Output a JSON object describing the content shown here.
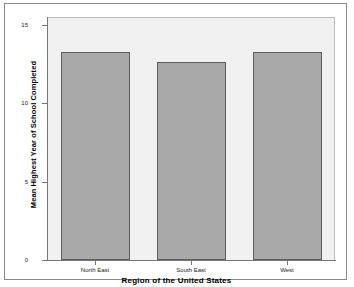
{
  "chart_data": {
    "type": "bar",
    "title": "",
    "subtitle": "",
    "categories": [
      "North East",
      "South East",
      "West"
    ],
    "values": [
      13.25,
      12.6,
      13.25
    ],
    "series": [
      {
        "name": "Mean Highest Year of School Completed",
        "values": [
          13.25,
          12.6,
          13.25
        ]
      }
    ],
    "xlabel": "Region of the United States",
    "ylabel": "Mean Highest Year of School Completed",
    "ylim": [
      0,
      15.5
    ],
    "yticks": [
      0,
      5,
      10,
      15
    ],
    "ytick_labels": [
      "0",
      "5",
      "10",
      "15"
    ],
    "grid": false,
    "legend": false,
    "legend_position": "none",
    "bar_fill_color": "#a9a9a9",
    "bar_border_color": "#5d5d5d",
    "plot_background_color": "#f1f1f1",
    "frame_color": "#8a8a8a",
    "axis_color": "#767676"
  }
}
